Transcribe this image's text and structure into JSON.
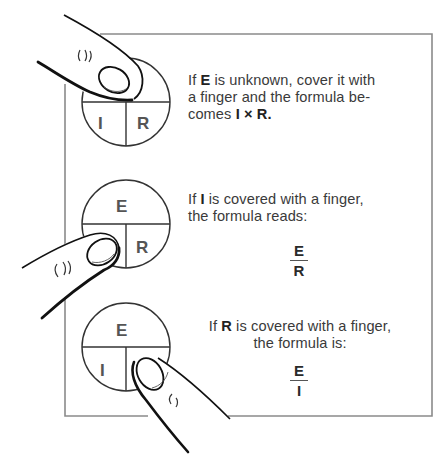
{
  "diagram": {
    "circle_labels": {
      "top": "E",
      "bottom_left": "I",
      "bottom_right": "R"
    },
    "panels": [
      {
        "covered": "E",
        "text_pre": "If ",
        "text_var": "E",
        "text_post": " is unknown, cover it with a finger and the formula be-comes ",
        "line1_pre": "If ",
        "line1_var": "E",
        "line1_post": " is unknown, cover it with",
        "line2": "a finger and the formula be-",
        "line3_pre": "comes ",
        "formula": "I × R",
        "line3_post": ".",
        "visible_labels": [
          "I",
          "R"
        ]
      },
      {
        "covered": "I",
        "line1_pre": "If ",
        "line1_var": "I",
        "line1_post": " is covered with a finger,",
        "line2": "the formula reads:",
        "formula_numerator": "E",
        "formula_denominator": "R",
        "visible_labels": [
          "E",
          "R"
        ]
      },
      {
        "covered": "R",
        "line1_pre": "If ",
        "line1_var": "R",
        "line1_post": " is covered with a finger,",
        "line2": "the formula is:",
        "formula_numerator": "E",
        "formula_denominator": "I",
        "visible_labels": [
          "E",
          "I"
        ]
      }
    ],
    "colors": {
      "frame": "#8a8a8a",
      "ink": "#222222",
      "text": "#3a3a3a"
    }
  }
}
